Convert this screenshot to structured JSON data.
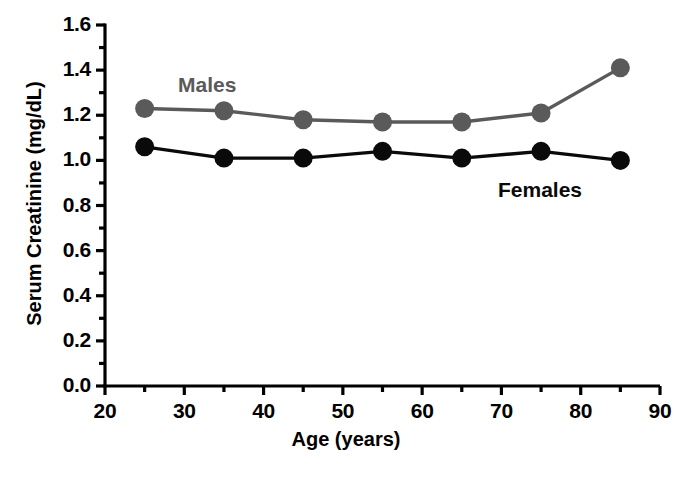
{
  "chart_data": {
    "type": "line",
    "title": "",
    "xlabel": "Age (years)",
    "ylabel": "Serum Creatinine (mg/dL)",
    "x": [
      25,
      35,
      45,
      55,
      65,
      75,
      85
    ],
    "xlim": [
      20,
      90
    ],
    "ylim": [
      0.0,
      1.6
    ],
    "xticks": [
      20,
      30,
      40,
      50,
      60,
      70,
      80,
      90
    ],
    "xtick_labels": [
      "20",
      "30",
      "40",
      "50",
      "60",
      "70",
      "80",
      "90"
    ],
    "x_minor_tick_step": 5,
    "yticks": [
      0.0,
      0.2,
      0.4,
      0.6,
      0.8,
      1.0,
      1.2,
      1.4,
      1.6
    ],
    "ytick_labels": [
      "0.0",
      "0.2",
      "0.4",
      "0.6",
      "0.8",
      "1.0",
      "1.2",
      "1.4",
      "1.6"
    ],
    "y_minor_tick_step": 0.1,
    "grid": false,
    "legend_position": "inline-annotations",
    "series": [
      {
        "name": "Males",
        "color": "#5a5a5a",
        "marker": "circle",
        "values": [
          1.23,
          1.22,
          1.18,
          1.17,
          1.17,
          1.21,
          1.41
        ]
      },
      {
        "name": "Females",
        "color": "#0a0a0a",
        "marker": "circle",
        "values": [
          1.06,
          1.01,
          1.01,
          1.04,
          1.01,
          1.04,
          1.0
        ]
      }
    ],
    "annotations": [
      {
        "text": "Males",
        "x": 32,
        "y": 1.45,
        "color": "#5a5a5a"
      },
      {
        "text": "Females",
        "x": 69,
        "y": 0.88,
        "color": "#0a0a0a"
      }
    ]
  },
  "caption": {
    "fragment": ""
  }
}
